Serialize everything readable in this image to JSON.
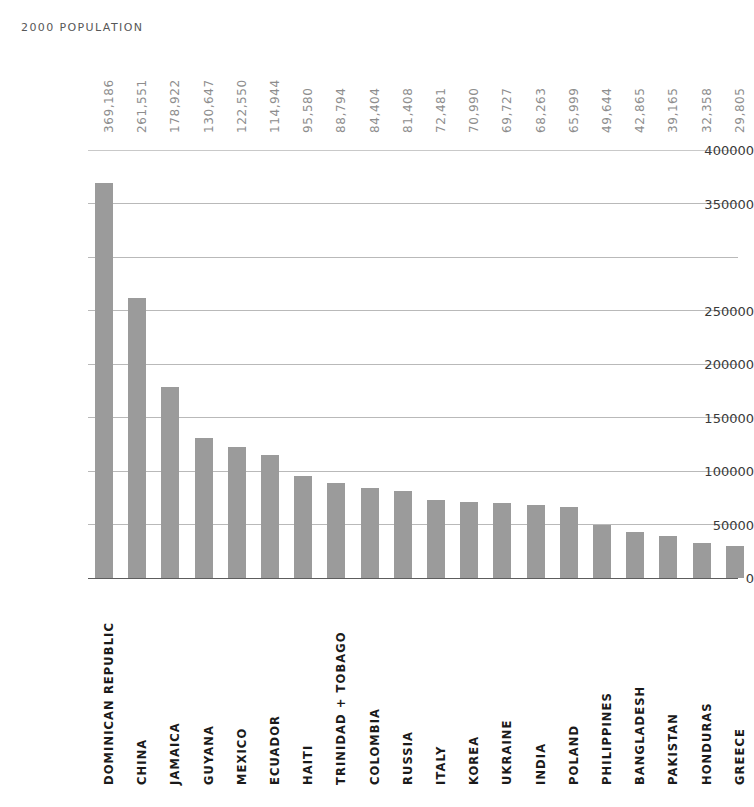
{
  "header": {
    "title": "2000 POPULATION"
  },
  "colors": {
    "bar": "#9b9b9b",
    "gridline": "#b9b9b9",
    "axis": "#5d5d5d",
    "value_label": "#8d8d8d",
    "category_label": "#1a1a1a",
    "title": "#575757",
    "background": "#ffffff"
  },
  "chart_data": {
    "type": "bar",
    "title": "2000 POPULATION",
    "xlabel": "",
    "ylabel": "",
    "ylim": [
      0,
      400000
    ],
    "grid": true,
    "legend": "none",
    "orientation": "vertical",
    "y_tick_labels": [
      "400000",
      "350000",
      "250000",
      "200000",
      "150000",
      "100000",
      "50000",
      "0"
    ],
    "y_gridline_values": [
      400000,
      350000,
      300000,
      250000,
      200000,
      150000,
      100000,
      50000,
      0
    ],
    "categories": [
      "DOMINICAN REPUBLIC",
      "CHINA",
      "JAMAICA",
      "GUYANA",
      "MEXICO",
      "ECUADOR",
      "HAITI",
      "TRINIDAD + TOBAGO",
      "COLOMBIA",
      "RUSSIA",
      "ITALY",
      "KOREA",
      "UKRAINE",
      "INDIA",
      "POLAND",
      "PHILIPPINES",
      "BANGLADESH",
      "PAKISTAN",
      "HONDURAS",
      "GREECE"
    ],
    "values": [
      369186,
      261551,
      178922,
      130647,
      122550,
      114944,
      95580,
      88794,
      84404,
      81408,
      72481,
      70990,
      69727,
      68263,
      65999,
      49644,
      42865,
      39165,
      32358,
      29805
    ],
    "value_labels": [
      "369,186",
      "261,551",
      "178,922",
      "130,647",
      "122,550",
      "114,944",
      "95,580",
      "88,794",
      "84,404",
      "81,408",
      "72,481",
      "70,990",
      "69,727",
      "68,263",
      "65,999",
      "49,644",
      "42,865",
      "39,165",
      "32,358",
      "29,805"
    ]
  }
}
